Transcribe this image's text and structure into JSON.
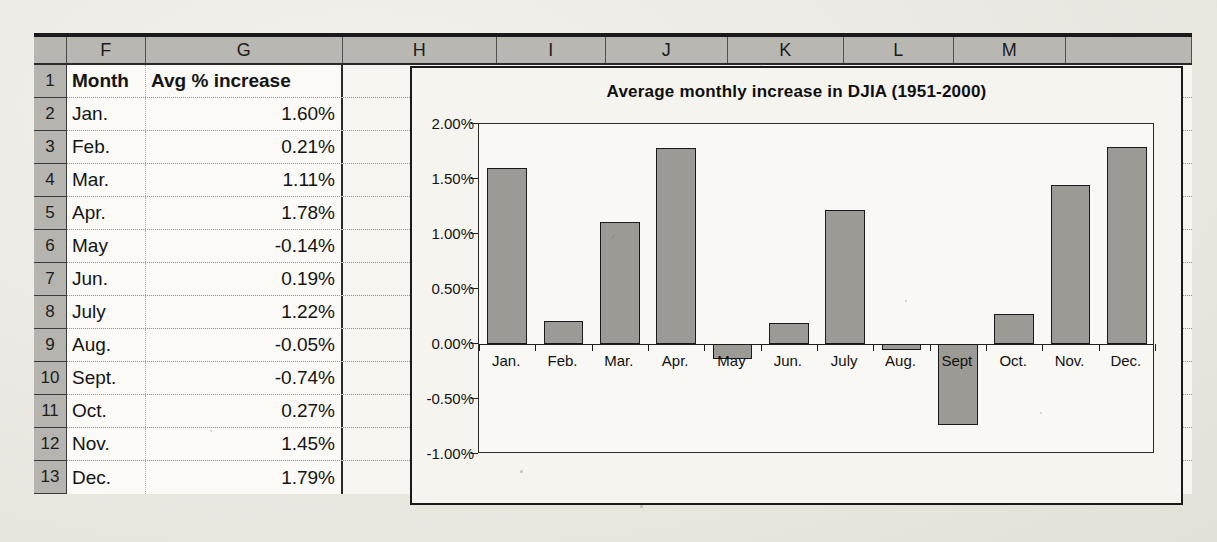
{
  "spreadsheet": {
    "column_headers": [
      "F",
      "G",
      "H",
      "I",
      "J",
      "K",
      "L",
      "M",
      "N"
    ],
    "row_headers": [
      "1",
      "2",
      "3",
      "4",
      "5",
      "6",
      "7",
      "8",
      "9",
      "10",
      "11",
      "12",
      "13"
    ],
    "header_row": {
      "month": "Month",
      "value": "Avg % increase"
    },
    "rows": [
      {
        "month": "Jan.",
        "value": "1.60%"
      },
      {
        "month": "Feb.",
        "value": "0.21%"
      },
      {
        "month": "Mar.",
        "value": "1.11%"
      },
      {
        "month": "Apr.",
        "value": "1.78%"
      },
      {
        "month": "May",
        "value": "-0.14%"
      },
      {
        "month": "Jun.",
        "value": "0.19%"
      },
      {
        "month": "July",
        "value": "1.22%"
      },
      {
        "month": "Aug.",
        "value": "-0.05%"
      },
      {
        "month": "Sept.",
        "value": "-0.74%"
      },
      {
        "month": "Oct.",
        "value": "0.27%"
      },
      {
        "month": "Nov.",
        "value": "1.45%"
      },
      {
        "month": "Dec.",
        "value": "1.79%"
      }
    ]
  },
  "chart_data": {
    "type": "bar",
    "title": "Average monthly increase in DJIA (1951-2000)",
    "xlabel": "",
    "ylabel": "",
    "categories": [
      "Jan.",
      "Feb.",
      "Mar.",
      "Apr.",
      "May",
      "Jun.",
      "July",
      "Aug.",
      "Sept",
      "Oct.",
      "Nov.",
      "Dec."
    ],
    "values": [
      1.6,
      0.21,
      1.11,
      1.78,
      -0.14,
      0.19,
      1.22,
      -0.05,
      -0.74,
      0.27,
      1.45,
      1.79
    ],
    "ylim": [
      -1.0,
      2.0
    ],
    "ytick_labels": [
      "2.00%",
      "1.50%",
      "1.00%",
      "0.50%",
      "0.00%",
      "-0.50%",
      "-1.00%"
    ],
    "ytick_values": [
      2.0,
      1.5,
      1.0,
      0.5,
      0.0,
      -0.5,
      -1.0
    ],
    "grid": false,
    "legend": false,
    "bar_fill": "#9c9a94",
    "bar_border": "#1a1a1a",
    "plot_background": "#faf8f4"
  }
}
